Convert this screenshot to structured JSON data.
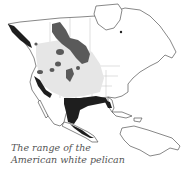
{
  "map": {
    "title": "The range of the American white pelican",
    "caption_lines": [
      "The range of the",
      "American white pelican"
    ],
    "region": "North America, Central America and Caribbean",
    "colors": {
      "land": "#ffffff",
      "coastline": "#444444",
      "borders": "#bdbdbd",
      "summer_range": "#5a5a5a",
      "winter_range": "#1e1e1e",
      "general_range": "#e6e6e6"
    },
    "legend": [
      {
        "label": "breeding range",
        "color": "#5a5a5a"
      },
      {
        "label": "winter range",
        "color": "#1e1e1e"
      },
      {
        "label": "migration range",
        "color": "#e6e6e6"
      }
    ]
  }
}
